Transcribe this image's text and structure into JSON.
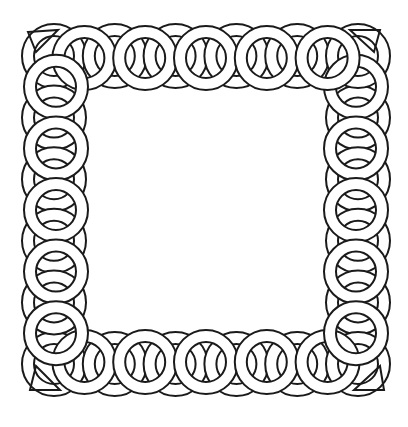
{
  "artwork": {
    "subject": "celtic-knotwork-square-frame",
    "colors": {
      "line": "#1a1a1a",
      "background": "#ffffff"
    },
    "frame": {
      "left": 28,
      "top": 30,
      "right": 384,
      "bottom": 390
    },
    "ring_radius": 26,
    "rings_per_side": 6
  }
}
